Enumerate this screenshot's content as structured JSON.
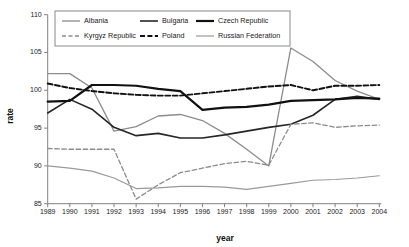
{
  "chart_data": {
    "type": "line",
    "title": "",
    "xlabel": "year",
    "ylabel": "rate",
    "x": [
      1989,
      1990,
      1991,
      1992,
      1993,
      1994,
      1995,
      1996,
      1997,
      1998,
      1999,
      2000,
      2001,
      2002,
      2003,
      2004
    ],
    "xtick_labels": [
      "1989",
      "1990",
      "1991",
      "1992",
      "1993",
      "1994",
      "1995",
      "1996",
      "1997",
      "1998",
      "1999",
      "2000",
      "2001",
      "2002",
      "2003",
      "2004"
    ],
    "ytick_labels": [
      "85",
      "90",
      "95",
      "100",
      "105",
      "110"
    ],
    "yticks": [
      85,
      90,
      95,
      100,
      105,
      110
    ],
    "xlim": [
      1989,
      2004
    ],
    "ylim": [
      85,
      110
    ],
    "grid": false,
    "legend_position": "top-center",
    "series": [
      {
        "name": "Albania",
        "color": "#8c8c8c",
        "style": "solid",
        "width": 1.3,
        "values": [
          102.2,
          102.2,
          100.3,
          94.6,
          95.2,
          96.6,
          96.8,
          96.0,
          94.3,
          92.2,
          90.0,
          105.6,
          103.8,
          101.3,
          99.9,
          98.8
        ]
      },
      {
        "name": "Bulgaria",
        "color": "#262626",
        "style": "solid",
        "width": 1.6,
        "values": [
          97.0,
          98.8,
          97.5,
          95.1,
          94.0,
          94.3,
          93.7,
          93.7,
          94.1,
          94.6,
          95.1,
          95.5,
          96.7,
          98.8,
          99.2,
          98.8
        ]
      },
      {
        "name": "Czech Republic",
        "color": "#111111",
        "style": "solid",
        "width": 2.2,
        "values": [
          98.5,
          98.6,
          100.7,
          100.7,
          100.6,
          100.2,
          99.9,
          97.4,
          97.7,
          97.8,
          98.1,
          98.6,
          98.7,
          98.8,
          99.0,
          98.9
        ]
      },
      {
        "name": "Kyrgyz Republic",
        "color": "#8c8c8c",
        "style": "dashed",
        "width": 1.3,
        "values": [
          92.3,
          92.2,
          92.2,
          92.2,
          85.6,
          87.5,
          89.1,
          89.7,
          90.3,
          90.6,
          90.1,
          95.5,
          95.7,
          95.1,
          95.3,
          95.4
        ]
      },
      {
        "name": "Poland",
        "color": "#111111",
        "style": "dashed",
        "width": 1.9,
        "values": [
          100.9,
          100.3,
          99.9,
          99.6,
          99.4,
          99.3,
          99.3,
          99.6,
          99.9,
          100.2,
          100.5,
          100.7,
          100.0,
          100.6,
          100.6,
          100.7
        ]
      },
      {
        "name": "Russian Federation",
        "color": "#9a9a9a",
        "style": "solid",
        "width": 1.2,
        "values": [
          90.0,
          89.7,
          89.3,
          88.4,
          87.0,
          87.1,
          87.3,
          87.3,
          87.2,
          86.9,
          87.3,
          87.7,
          88.1,
          88.2,
          88.4,
          88.7
        ]
      }
    ]
  }
}
